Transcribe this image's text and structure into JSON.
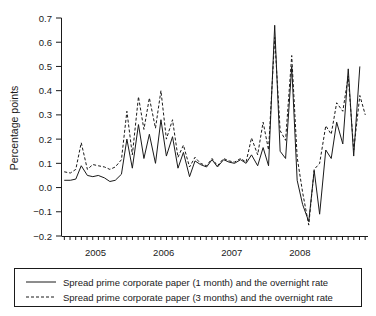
{
  "chart_data": {
    "type": "line",
    "title": "",
    "xlabel": "",
    "ylabel": "Percentage points",
    "ylim": [
      -0.2,
      0.7
    ],
    "yticks": [
      -0.2,
      -0.1,
      0.0,
      0.1,
      0.2,
      0.3,
      0.4,
      0.5,
      0.6,
      0.7
    ],
    "yticklabels": [
      "-0.2",
      "-0.1",
      "0.0",
      "0.1",
      "0.2",
      "0.3",
      "0.4",
      "0.5",
      "0.6",
      "0.7"
    ],
    "xlim": [
      2004.5,
      2009.0
    ],
    "xticks": [
      2005,
      2006,
      2007,
      2008
    ],
    "xticklabels": [
      "2005",
      "2006",
      "2007",
      "2008"
    ],
    "minor_tick_interval": 0.0833,
    "grid": false,
    "legend_position": "below-axes",
    "series": [
      {
        "name": "Spread prime corporate paper (1 month) and the overnight rate",
        "style": "solid",
        "x": [
          2004.54,
          2004.63,
          2004.71,
          2004.79,
          2004.88,
          2004.96,
          2005.04,
          2005.13,
          2005.21,
          2005.29,
          2005.38,
          2005.46,
          2005.54,
          2005.63,
          2005.71,
          2005.79,
          2005.88,
          2005.96,
          2006.04,
          2006.13,
          2006.21,
          2006.29,
          2006.38,
          2006.46,
          2006.54,
          2006.63,
          2006.71,
          2006.79,
          2006.88,
          2006.96,
          2007.04,
          2007.13,
          2007.21,
          2007.29,
          2007.38,
          2007.46,
          2007.54,
          2007.63,
          2007.71,
          2007.79,
          2007.88,
          2007.96,
          2008.04,
          2008.13,
          2008.21,
          2008.29,
          2008.38,
          2008.46,
          2008.54,
          2008.63,
          2008.71,
          2008.79,
          2008.88
        ],
        "values": [
          0.03,
          0.03,
          0.035,
          0.09,
          0.05,
          0.045,
          0.05,
          0.04,
          0.025,
          0.03,
          0.055,
          0.2,
          0.08,
          0.26,
          0.12,
          0.22,
          0.1,
          0.28,
          0.13,
          0.21,
          0.08,
          0.145,
          0.045,
          0.11,
          0.095,
          0.085,
          0.115,
          0.085,
          0.115,
          0.105,
          0.1,
          0.115,
          0.1,
          0.135,
          0.09,
          0.165,
          0.09,
          0.67,
          0.15,
          0.12,
          0.5,
          0.03,
          -0.07,
          -0.14,
          0.07,
          -0.11,
          0.155,
          0.12,
          0.27,
          0.18,
          0.49,
          0.13,
          0.5
        ]
      },
      {
        "name": "Spread prime corporate paper (3 months) and the overnight rate",
        "style": "dashed",
        "x": [
          2004.54,
          2004.63,
          2004.71,
          2004.79,
          2004.88,
          2004.96,
          2005.04,
          2005.13,
          2005.21,
          2005.29,
          2005.38,
          2005.46,
          2005.54,
          2005.63,
          2005.71,
          2005.79,
          2005.88,
          2005.96,
          2006.04,
          2006.13,
          2006.21,
          2006.29,
          2006.38,
          2006.46,
          2006.54,
          2006.63,
          2006.71,
          2006.79,
          2006.88,
          2006.96,
          2007.04,
          2007.13,
          2007.21,
          2007.29,
          2007.38,
          2007.46,
          2007.54,
          2007.63,
          2007.71,
          2007.79,
          2007.88,
          2007.96,
          2008.04,
          2008.13,
          2008.21,
          2008.29,
          2008.38,
          2008.46,
          2008.54,
          2008.63,
          2008.71,
          2008.79,
          2008.88,
          2008.96
        ],
        "values": [
          0.065,
          0.06,
          0.075,
          0.185,
          0.075,
          0.095,
          0.09,
          0.085,
          0.075,
          0.085,
          0.115,
          0.315,
          0.135,
          0.375,
          0.24,
          0.37,
          0.245,
          0.4,
          0.2,
          0.28,
          0.125,
          0.175,
          0.085,
          0.125,
          0.1,
          0.09,
          0.12,
          0.09,
          0.12,
          0.11,
          0.105,
          0.12,
          0.105,
          0.205,
          0.135,
          0.27,
          0.155,
          0.62,
          0.235,
          0.195,
          0.545,
          0.125,
          -0.02,
          -0.155,
          0.075,
          0.1,
          0.255,
          0.22,
          0.35,
          0.315,
          0.46,
          0.155,
          0.38,
          0.3
        ]
      }
    ]
  },
  "legend": {
    "entries": [
      {
        "label": "Spread prime corporate paper (1 month) and the overnight rate",
        "style": "solid"
      },
      {
        "label": "Spread prime corporate paper (3 months) and the overnight rate",
        "style": "dashed"
      }
    ]
  }
}
